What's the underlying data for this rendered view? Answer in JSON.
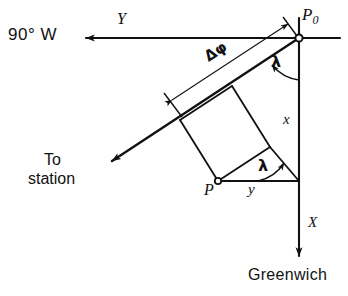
{
  "figure": {
    "type": "geometric-vector-diagram",
    "background_color": "#ffffff",
    "line_color": "#111111",
    "width": 348,
    "height": 296
  },
  "labels": {
    "west_meridian": "90° W",
    "y_axis": "Y",
    "origin_point": "P",
    "origin_point_subscript": "0",
    "lambda_upper": "λ",
    "lambda_lower": "λ",
    "delta_phi": "Δφ",
    "x_leg": "x",
    "y_leg": "y",
    "to_station_line1": "To",
    "to_station_line2": "station",
    "station_point": "P",
    "x_axis": "X",
    "greenwich": "Greenwich"
  },
  "geometry": {
    "points": {
      "P0": [
        299,
        38
      ],
      "P": [
        218,
        181
      ],
      "corner": [
        299,
        181
      ],
      "y_arrow_tip": [
        80,
        38
      ],
      "x_arrow_tip": [
        299,
        262
      ],
      "station_arrow_tip": [
        105,
        165
      ]
    },
    "angles": {
      "lambda_upper_deg": 30,
      "lambda_lower_deg": 30
    },
    "node_marker_radius": 3.5
  },
  "annotations": {
    "dimension_label": "Δφ",
    "dimension_from": [
      170,
      98
    ],
    "dimension_to": [
      290,
      34
    ]
  }
}
